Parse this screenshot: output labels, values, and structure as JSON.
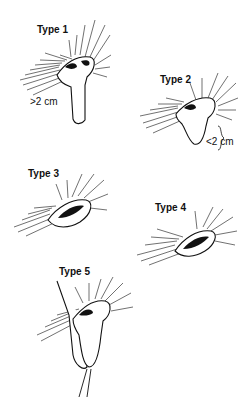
{
  "figures": [
    {
      "id": "type-1",
      "label": "Type 1",
      "measurement": ">2 cm"
    },
    {
      "id": "type-2",
      "label": "Type 2",
      "measurement": "<2 cm"
    },
    {
      "id": "type-3",
      "label": "Type 3",
      "measurement": ""
    },
    {
      "id": "type-4",
      "label": "Type 4",
      "measurement": ""
    },
    {
      "id": "type-5",
      "label": "Type 5",
      "measurement": ""
    }
  ],
  "colors": {
    "ink": "#111111",
    "background": "#ffffff"
  }
}
